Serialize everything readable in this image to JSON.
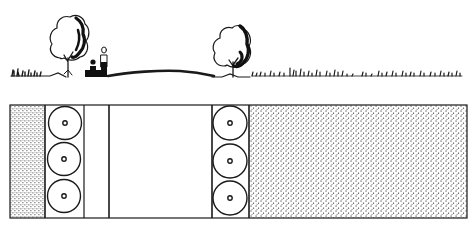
{
  "diagram": {
    "type": "landscape section and plan",
    "colors": {
      "ink": "#1a1a1a",
      "paper": "#ffffff",
      "stipple": "#3a3a3a"
    },
    "section": {
      "elements": [
        "grass-left",
        "tree-left",
        "seated-person",
        "standing-person",
        "mound",
        "tree-right",
        "grass-right"
      ]
    },
    "plan": {
      "zones": [
        {
          "name": "stipple-left",
          "x0": 10,
          "x1": 45
        },
        {
          "name": "tree-column-left",
          "x0": 45,
          "x1": 84,
          "trees": 3
        },
        {
          "name": "path-strip",
          "x0": 84,
          "x1": 109
        },
        {
          "name": "open-lawn",
          "x0": 109,
          "x1": 212
        },
        {
          "name": "tree-column-right",
          "x0": 212,
          "x1": 249,
          "trees": 3
        },
        {
          "name": "stipple-right",
          "x0": 249,
          "x1": 467
        }
      ]
    }
  }
}
